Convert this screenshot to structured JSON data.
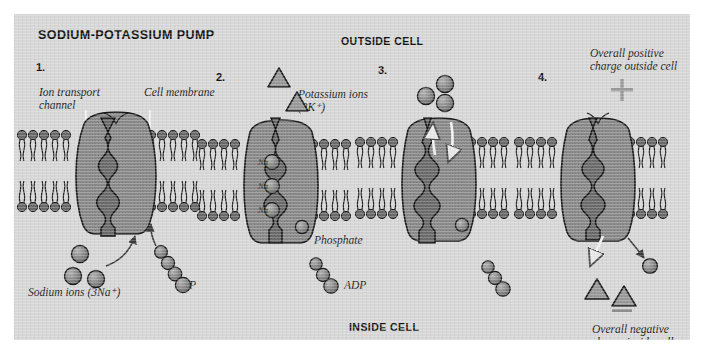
{
  "figure": {
    "title": "SODIUM-POTASSIUM PUMP",
    "outside_label": "OUTSIDE CELL",
    "inside_label": "INSIDE CELL",
    "background_color": "#d7d7d7",
    "ink_color": "#1b1b1b",
    "protein_color": "#8c8c8c",
    "membrane_color": "#7d7d7d"
  },
  "panels": [
    {
      "number": "1.",
      "labels": {
        "ion_channel": "Ion transport\nchannel",
        "cell_membrane": "Cell membrane",
        "sodium": "Sodium ions (3Na⁺)",
        "atp": "ATP"
      },
      "sodium_ion_count": 3,
      "atp_phosphate_count": 4
    },
    {
      "number": "2.",
      "labels": {
        "potassium": "Potassium ions\n(2K⁺)",
        "phosphate": "Phosphate",
        "adp": "ADP"
      },
      "potassium_triangle_count": 2,
      "bound_sodium_labels": [
        "Na",
        "Na",
        "Na"
      ],
      "adp_phosphate_count": 3
    },
    {
      "number": "3.",
      "labels": {},
      "released_sodium_count": 3,
      "adp_phosphate_count": 3
    },
    {
      "number": "4.",
      "labels": {
        "positive": "Overall positive\ncharge outside cell",
        "negative": "Overall negative\ncharge inside cell",
        "plus_sign": "+",
        "minus_sign": "—"
      },
      "released_potassium_count": 2,
      "released_phosphate_count": 1
    }
  ]
}
